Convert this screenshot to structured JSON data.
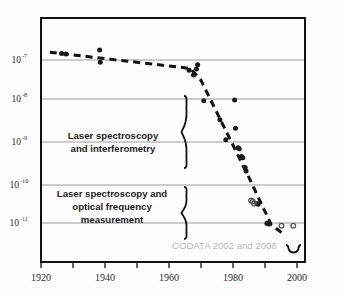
{
  "chart_data": {
    "type": "scatter",
    "title": "",
    "xlabel": "",
    "ylabel": "",
    "xlim": [
      1920,
      2010
    ],
    "ylim_log": [
      -11.7,
      -6.55
    ],
    "grid": true,
    "legend_position": "none",
    "x_ticks_major": [
      1920,
      1940,
      1960,
      1980,
      2000
    ],
    "x_ticks_minor": [
      1930,
      1950,
      1970,
      1990
    ],
    "y_ticks": [
      {
        "mantissa": "10",
        "exponent": "-7",
        "value": 1e-07
      },
      {
        "mantissa": "10",
        "exponent": "-8",
        "value": 1e-08
      },
      {
        "mantissa": "10",
        "exponent": "-9",
        "value": 1e-09
      },
      {
        "mantissa": "10",
        "exponent": "-10",
        "value": 1e-10
      },
      {
        "mantissa": "10",
        "exponent": "-11",
        "value": 1e-11
      }
    ],
    "series": [
      {
        "name": "measurements-filled",
        "marker": "filled-circle",
        "color": "#1a1a1a",
        "points": [
          {
            "x": 1927.0,
            "y": 1.45e-07
          },
          {
            "x": 1928.5,
            "y": 1.4e-07
          },
          {
            "x": 1940.0,
            "y": 1.75e-07
          },
          {
            "x": 1940.2,
            "y": 8.8e-08
          },
          {
            "x": 1970.5,
            "y": 5.6e-08
          },
          {
            "x": 1972.0,
            "y": 4.3e-08
          },
          {
            "x": 1973.0,
            "y": 6e-08
          },
          {
            "x": 1973.4,
            "y": 7.6e-08
          },
          {
            "x": 1975.5,
            "y": 1e-08
          },
          {
            "x": 1981.0,
            "y": 3.4e-09
          },
          {
            "x": 1983.0,
            "y": 1.1e-09
          },
          {
            "x": 1986.0,
            "y": 1.05e-08
          },
          {
            "x": 1986.3,
            "y": 2.1e-09
          },
          {
            "x": 1987.2,
            "y": 7e-10
          },
          {
            "x": 1987.6,
            "y": 6.6e-10
          },
          {
            "x": 1988.4,
            "y": 4.3e-10
          },
          {
            "x": 1988.8,
            "y": 4e-10
          },
          {
            "x": 1989.6,
            "y": 2.3e-10
          },
          {
            "x": 1989.9,
            "y": 1.9e-10
          },
          {
            "x": 1993.6,
            "y": 3e-11
          },
          {
            "x": 1994.0,
            "y": 2.9e-11
          },
          {
            "x": 1997.0,
            "y": 9.9e-12
          },
          {
            "x": 1997.6,
            "y": 9.5e-12
          }
        ]
      },
      {
        "name": "measurements-open",
        "marker": "open-circle",
        "color": "#555555",
        "points": [
          {
            "x": 1991.6,
            "y": 3.6e-11
          },
          {
            "x": 1992.2,
            "y": 3.4e-11
          },
          {
            "x": 1992.6,
            "y": 3e-11
          },
          {
            "x": 2002.0,
            "y": 8.6e-12
          },
          {
            "x": 2006.0,
            "y": 8.6e-12
          }
        ]
      }
    ],
    "trend_line": {
      "name": "dashed-trend",
      "style": "dashed",
      "color": "#111111",
      "vertices": [
        {
          "x": 1923.0,
          "y": 1.55e-07
        },
        {
          "x": 1971.0,
          "y": 6.2e-08
        },
        {
          "x": 1974.5,
          "y": 3.2e-08
        },
        {
          "x": 1990.5,
          "y": 1.5e-10
        },
        {
          "x": 1998.5,
          "y": 9e-12
        },
        {
          "x": 2002.5,
          "y": 5.5e-12
        }
      ]
    },
    "annotations": [
      {
        "id": "upper-group",
        "lines": [
          "Laser spectroscopy",
          "and interferometry"
        ],
        "brace": {
          "y_top": 1.5e-08,
          "y_bottom": 1e-10
        }
      },
      {
        "id": "lower-group",
        "lines": [
          "Laser spectroscopy and",
          "optical frequency",
          "measurement"
        ],
        "brace": {
          "y_top": 1.05e-10,
          "y_bottom": 4e-12
        }
      },
      {
        "id": "codata-note",
        "text": "CODATA 2002 and 2006",
        "color": "#b9b9b9"
      }
    ]
  },
  "colors": {
    "frame": "#111111",
    "gridline": "#9a9a9a",
    "marker_filled": "#1a1a1a",
    "marker_open": "#555555",
    "trend": "#111111",
    "annotation_text": "#1d1d1d",
    "codata_text": "#b9b9b9",
    "background": "#fdfdfd"
  }
}
